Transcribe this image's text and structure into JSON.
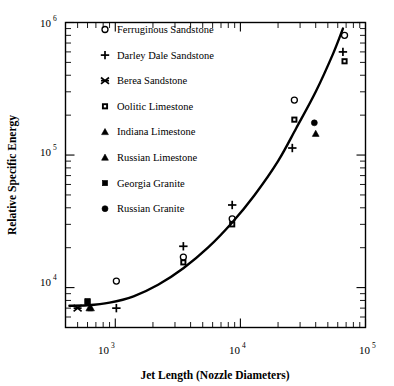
{
  "chart_data": {
    "type": "scatter",
    "title": "",
    "xlabel": "Jet Length (Nozzle Diameters)",
    "ylabel": "Relative Specific Energy",
    "xscale": "log",
    "yscale": "log",
    "xlim": [
      400,
      100000
    ],
    "ylim": [
      5000,
      1000000
    ],
    "xticks": [
      "10^3",
      "10^4",
      "10^5"
    ],
    "xtick_labels": [
      "10",
      "10",
      "10"
    ],
    "xtick_exponents": [
      "3",
      "4",
      "5"
    ],
    "yticks": [
      "10^4",
      "10^5",
      "10^6"
    ],
    "ytick_labels": [
      "10",
      "10",
      "10"
    ],
    "ytick_exponents": [
      "4",
      "5",
      "6"
    ],
    "grid": false,
    "legend_position": "upper-left-inside",
    "legend": [
      {
        "label": "Ferruginous Sandstone",
        "marker": "open-circle"
      },
      {
        "label": "Darley Dale Sandstone",
        "marker": "plus"
      },
      {
        "label": "Berea Sandstone",
        "marker": "cross-star"
      },
      {
        "label": "Oolitic Limestone",
        "marker": "small-filled-square"
      },
      {
        "label": "Indiana Limestone",
        "marker": "filled-triangle"
      },
      {
        "label": "Russian Limestone",
        "marker": "filled-triangle"
      },
      {
        "label": "Georgia Granite",
        "marker": "filled-square"
      },
      {
        "label": "Russian Granite",
        "marker": "filled-circle"
      }
    ],
    "series": [
      {
        "name": "Ferruginous Sandstone",
        "marker": "open-circle",
        "points": [
          {
            "x": 1020,
            "y": 11200
          },
          {
            "x": 3500,
            "y": 17000
          },
          {
            "x": 8600,
            "y": 33000
          },
          {
            "x": 27000,
            "y": 260000
          },
          {
            "x": 68000,
            "y": 800000
          }
        ]
      },
      {
        "name": "Darley Dale Sandstone",
        "marker": "plus",
        "points": [
          {
            "x": 1020,
            "y": 7000
          },
          {
            "x": 3500,
            "y": 20500
          },
          {
            "x": 8600,
            "y": 42000
          },
          {
            "x": 26000,
            "y": 113000
          },
          {
            "x": 66000,
            "y": 600000
          }
        ]
      },
      {
        "name": "Berea Sandstone",
        "marker": "cross-star",
        "points": [
          {
            "x": 500,
            "y": 7000
          }
        ]
      },
      {
        "name": "Oolitic Limestone",
        "marker": "small-filled-square",
        "points": [
          {
            "x": 600,
            "y": 7800
          },
          {
            "x": 3500,
            "y": 15500
          },
          {
            "x": 8600,
            "y": 30000
          },
          {
            "x": 27000,
            "y": 185000
          },
          {
            "x": 68000,
            "y": 510000
          }
        ]
      },
      {
        "name": "Indiana Limestone",
        "marker": "filled-triangle",
        "points": [
          {
            "x": 620,
            "y": 7000
          }
        ]
      },
      {
        "name": "Russian Limestone",
        "marker": "filled-triangle",
        "points": [
          {
            "x": 640,
            "y": 7000
          },
          {
            "x": 40000,
            "y": 145000
          }
        ]
      },
      {
        "name": "Georgia Granite",
        "marker": "filled-square",
        "points": [
          {
            "x": 600,
            "y": 7900
          }
        ]
      },
      {
        "name": "Russian Granite",
        "marker": "filled-circle",
        "points": [
          {
            "x": 39000,
            "y": 175000
          }
        ]
      }
    ],
    "fit_curve": {
      "name": "power-law fit",
      "points": [
        {
          "x": 430,
          "y": 7300
        },
        {
          "x": 600,
          "y": 7350
        },
        {
          "x": 900,
          "y": 7700
        },
        {
          "x": 1400,
          "y": 8600
        },
        {
          "x": 2200,
          "y": 10500
        },
        {
          "x": 3500,
          "y": 14000
        },
        {
          "x": 5500,
          "y": 20000
        },
        {
          "x": 8600,
          "y": 31000
        },
        {
          "x": 13000,
          "y": 50000
        },
        {
          "x": 20000,
          "y": 90000
        },
        {
          "x": 28000,
          "y": 160000
        },
        {
          "x": 40000,
          "y": 300000
        },
        {
          "x": 55000,
          "y": 580000
        },
        {
          "x": 66000,
          "y": 900000
        }
      ]
    }
  }
}
